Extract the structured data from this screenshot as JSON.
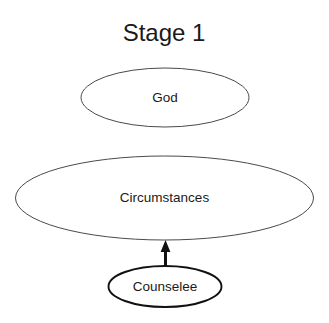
{
  "diagram": {
    "title": "Stage 1",
    "background_color": "#ffffff",
    "text_color": "#1a1a1a",
    "nodes": [
      {
        "id": "god",
        "label": "God",
        "shape": "ellipse",
        "stroke_color": "#4a4a4a",
        "stroke_weight": "thin",
        "cx": 165,
        "cy": 97,
        "rx": 84,
        "ry": 29
      },
      {
        "id": "circumstances",
        "label": "Circumstances",
        "shape": "ellipse",
        "stroke_color": "#4a4a4a",
        "stroke_weight": "thin",
        "cx": 164,
        "cy": 198,
        "rx": 149,
        "ry": 42
      },
      {
        "id": "counselee",
        "label": "Counselee",
        "shape": "ellipse",
        "stroke_color": "#111111",
        "stroke_weight": "thick",
        "cx": 165,
        "cy": 286,
        "rx": 57,
        "ry": 20
      }
    ],
    "connectors": [
      {
        "id": "counselee-to-circumstances",
        "from": "counselee",
        "to": "circumstances",
        "direction": "up",
        "arrowhead": "filled-triangle",
        "color": "#111111",
        "x": 165,
        "y_start": 268,
        "y_end": 240
      }
    ]
  }
}
